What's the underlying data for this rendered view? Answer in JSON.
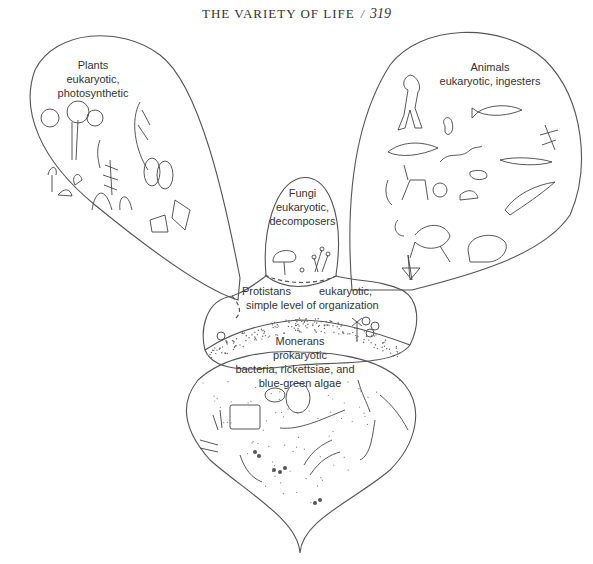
{
  "header": {
    "title": "THE VARIETY OF LIFE",
    "separator": "/",
    "page_number": "319"
  },
  "kingdoms": {
    "plants": {
      "name": "Plants",
      "line1": "eukaryotic,",
      "line2": "photosynthetic"
    },
    "animals": {
      "name": "Animals",
      "line1": "eukaryotic, ingesters"
    },
    "fungi": {
      "name": "Fungi",
      "line1": "eukaryotic,",
      "line2": "decomposers"
    },
    "protistans": {
      "name": "Protistans",
      "line1": "eukaryotic,",
      "line2": "simple level of organization"
    },
    "monerans": {
      "name": "Monerans",
      "line1": "prokaryotic",
      "line2": "bacteria, rickettsiae, and",
      "line3": "blue-green algae"
    }
  },
  "illustrations": {
    "plants": [
      "flowering-plant",
      "fern",
      "grass",
      "mushroom-like-plant",
      "moss",
      "leafy-plant",
      "cactus"
    ],
    "animals": [
      "human",
      "squirrel",
      "fish",
      "insect",
      "shark",
      "snake",
      "lizard",
      "deer",
      "bee",
      "snail",
      "bird",
      "crab",
      "frog",
      "starfish",
      "bear",
      "worm"
    ],
    "fungi": [
      "mushroom",
      "mold-sporangia"
    ],
    "protistans": [
      "amoeba",
      "diatom",
      "radiolarian"
    ],
    "monerans": [
      "rod-bacteria",
      "cocci-clusters",
      "spirilla",
      "filaments",
      "chain-bacteria"
    ]
  }
}
